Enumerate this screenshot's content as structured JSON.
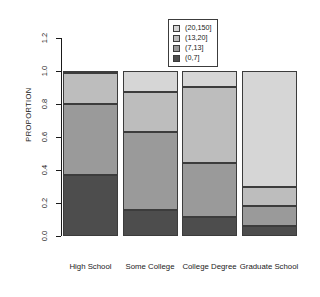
{
  "chart_data": {
    "type": "bar",
    "subtype": "stacked-proportion",
    "title": "",
    "xlabel": "",
    "ylabel": "PROPORTION",
    "categories": [
      "High School",
      "Some College",
      "College Degree",
      "Graduate School"
    ],
    "ylim": [
      0.0,
      1.2
    ],
    "ytick_labels": [
      "0.0",
      "0.2",
      "0.4",
      "0.6",
      "0.8",
      "1.0",
      "1.2"
    ],
    "ytick_values": [
      0.0,
      0.2,
      0.4,
      0.6,
      0.8,
      1.0,
      1.2
    ],
    "grid": false,
    "legend_position": "top-right",
    "legend_title": "",
    "series": [
      {
        "name": "(0,7]",
        "color": "#4d4d4d",
        "values": [
          0.37,
          0.16,
          0.115,
          0.06
        ]
      },
      {
        "name": "(7,13]",
        "color": "#9a9a9a",
        "values": [
          0.43,
          0.47,
          0.33,
          0.12
        ]
      },
      {
        "name": "(13,20]",
        "color": "#bdbdbd",
        "values": [
          0.19,
          0.24,
          0.46,
          0.115
        ]
      },
      {
        "name": "(20,150]",
        "color": "#d6d6d6",
        "values": [
          0.01,
          0.13,
          0.095,
          0.705
        ]
      }
    ],
    "legend_entries": [
      {
        "label": "(20,150]",
        "color": "#d6d6d6"
      },
      {
        "label": "(13,20]",
        "color": "#bdbdbd"
      },
      {
        "label": "(7,13]",
        "color": "#9a9a9a"
      },
      {
        "label": "(0,7]",
        "color": "#4d4d4d"
      }
    ],
    "colors": {
      "axis": "#1a1a1a",
      "border": "#3c3c3c",
      "background": "#ffffff"
    }
  }
}
